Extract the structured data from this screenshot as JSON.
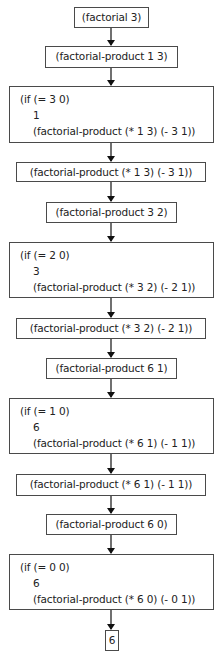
{
  "diagram": {
    "nodes": [
      {
        "id": "n1",
        "type": "single",
        "text": "(factorial 3)"
      },
      {
        "id": "n2",
        "type": "single",
        "text": "(factorial-product 1 3)"
      },
      {
        "id": "n3",
        "type": "multi",
        "lines": [
          "(if (= 3 0)",
          "1",
          "(factorial-product (* 1 3) (- 3 1))"
        ]
      },
      {
        "id": "n4",
        "type": "single",
        "text": "(factorial-product (* 1 3) (- 3 1))"
      },
      {
        "id": "n5",
        "type": "single",
        "text": "(factorial-product 3 2)"
      },
      {
        "id": "n6",
        "type": "multi",
        "lines": [
          "(if (= 2 0)",
          "3",
          "(factorial-product (* 3 2) (- 2 1))"
        ]
      },
      {
        "id": "n7",
        "type": "single",
        "text": "(factorial-product (* 3 2) (- 2 1))"
      },
      {
        "id": "n8",
        "type": "single",
        "text": "(factorial-product 6 1)"
      },
      {
        "id": "n9",
        "type": "multi",
        "lines": [
          "(if (= 1 0)",
          "6",
          "(factorial-product (* 6 1) (- 1 1))"
        ]
      },
      {
        "id": "n10",
        "type": "single",
        "text": "(factorial-product (* 6 1) (- 1 1))"
      },
      {
        "id": "n11",
        "type": "single",
        "text": "(factorial-product 6 0)"
      },
      {
        "id": "n12",
        "type": "multi",
        "lines": [
          "(if (= 0 0)",
          "6",
          "(factorial-product (* 6 0) (- 0 1))"
        ]
      },
      {
        "id": "n13",
        "type": "single",
        "text": "6"
      }
    ],
    "edges": [
      [
        "n1",
        "n2"
      ],
      [
        "n2",
        "n3"
      ],
      [
        "n3",
        "n4"
      ],
      [
        "n4",
        "n5"
      ],
      [
        "n5",
        "n6"
      ],
      [
        "n6",
        "n7"
      ],
      [
        "n7",
        "n8"
      ],
      [
        "n8",
        "n9"
      ],
      [
        "n9",
        "n10"
      ],
      [
        "n10",
        "n11"
      ],
      [
        "n11",
        "n12"
      ],
      [
        "n12",
        "n13"
      ]
    ],
    "colors": {
      "border": "#4a4a4a",
      "arrow": "#111111",
      "text": "#222222",
      "background": "#ffffff"
    }
  }
}
